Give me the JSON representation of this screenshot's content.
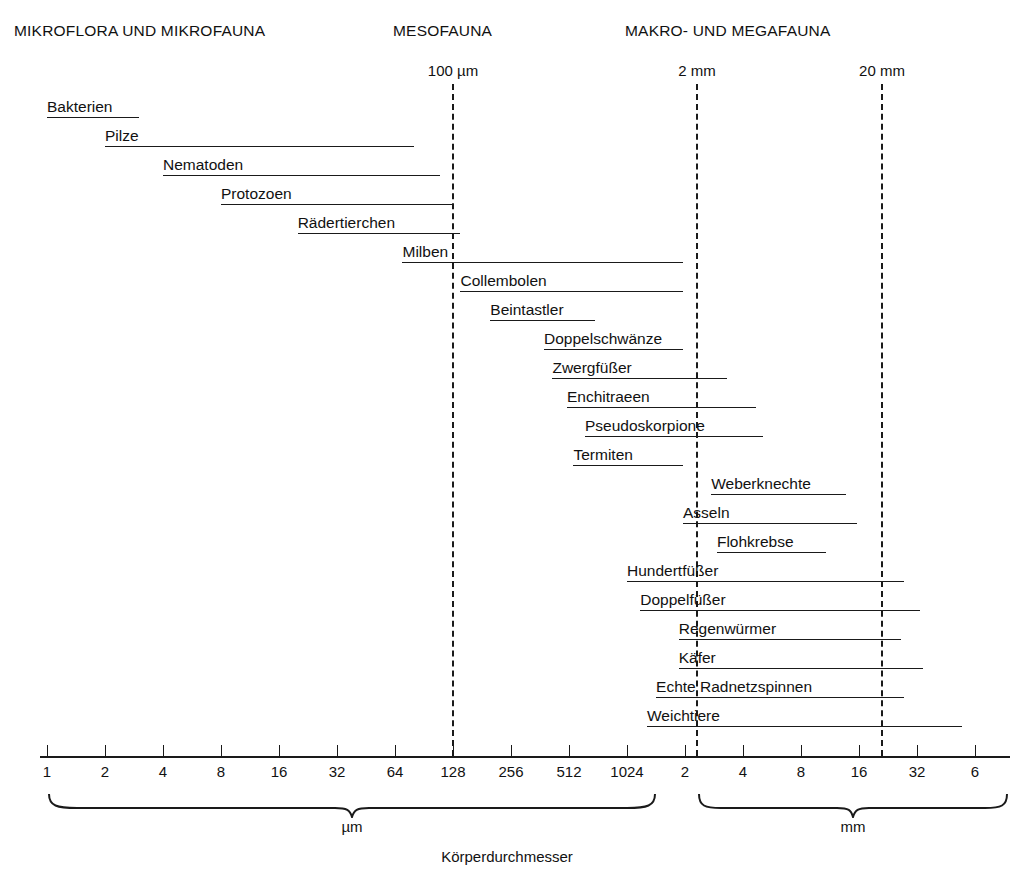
{
  "chart_data": {
    "type": "bar",
    "title": "Körperdurchmesser",
    "xlabel": "Körperdurchmesser",
    "ylabel": "",
    "scale": "log2",
    "axis": {
      "tick_labels": [
        "1",
        "2",
        "4",
        "8",
        "16",
        "32",
        "64",
        "128",
        "256",
        "512",
        "1024",
        "2",
        "4",
        "8",
        "16",
        "32",
        "6"
      ],
      "unit_segments": [
        {
          "label": "µm",
          "from": "1",
          "to": "1024"
        },
        {
          "label": "mm",
          "from": "2",
          "to": "64"
        }
      ]
    },
    "gridlines": [
      {
        "label": "100 µm",
        "value_um": 100
      },
      {
        "label": "2 mm",
        "value_um": 2000
      },
      {
        "label": "20 mm",
        "value_um": 20000
      }
    ],
    "categories": [
      {
        "label": "MIKROFLORA UND MIKROFAUNA"
      },
      {
        "label": "MESOFAUNA"
      },
      {
        "label": "MAKRO- UND MEGAFAUNA"
      }
    ],
    "series_name": "Körperdurchmesser-Spannweite",
    "organisms": [
      {
        "label": "Bakterien",
        "min_um": 1,
        "max_um": 3
      },
      {
        "label": "Pilze",
        "min_um": 2,
        "max_um": 80
      },
      {
        "label": "Nematoden",
        "min_um": 4,
        "max_um": 110
      },
      {
        "label": "Protozoen",
        "min_um": 8,
        "max_um": 128
      },
      {
        "label": "Rädertierchen",
        "min_um": 20,
        "max_um": 140
      },
      {
        "label": "Milben",
        "min_um": 70,
        "max_um": 2000
      },
      {
        "label": "Collembolen",
        "min_um": 140,
        "max_um": 2000
      },
      {
        "label": "Beintastler",
        "min_um": 200,
        "max_um": 700
      },
      {
        "label": "Doppelschwänze",
        "min_um": 380,
        "max_um": 2000
      },
      {
        "label": "Zwergfüßer",
        "min_um": 420,
        "max_um": 3400
      },
      {
        "label": "Enchitraeen",
        "min_um": 500,
        "max_um": 4800
      },
      {
        "label": "Pseudoskorpione",
        "min_um": 620,
        "max_um": 5200
      },
      {
        "label": "Termiten",
        "min_um": 540,
        "max_um": 2000
      },
      {
        "label": "Weberknechte",
        "min_um": 2800,
        "max_um": 14000
      },
      {
        "label": "Asseln",
        "min_um": 2000,
        "max_um": 16000
      },
      {
        "label": "Flohkrebse",
        "min_um": 3000,
        "max_um": 11000
      },
      {
        "label": "Hundertfüßer",
        "min_um": 1024,
        "max_um": 28000
      },
      {
        "label": "Doppelfüßer",
        "min_um": 1200,
        "max_um": 34000
      },
      {
        "label": "Regenwürmer",
        "min_um": 1900,
        "max_um": 27000
      },
      {
        "label": "Käfer",
        "min_um": 1900,
        "max_um": 35000
      },
      {
        "label": "Echte Radnetzspinnen",
        "min_um": 1450,
        "max_um": 28000
      },
      {
        "label": "Weichtiere",
        "min_um": 1300,
        "max_um": 56000
      }
    ]
  }
}
